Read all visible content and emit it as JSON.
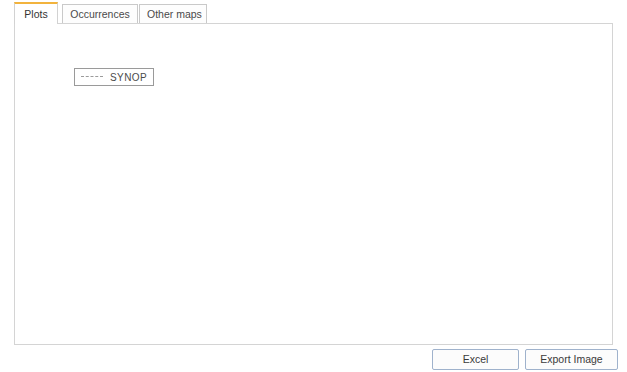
{
  "tabs": [
    {
      "label": "Plots",
      "active": true
    },
    {
      "label": "Occurrences",
      "active": false
    },
    {
      "label": "Other maps",
      "active": false
    }
  ],
  "buttons": {
    "excel": "Excel",
    "export_image": "Export Image"
  },
  "chart_data": {
    "type": "line",
    "title": "Monthly averaged visibility values over station 07157",
    "xlabel": "Months",
    "ylabel": "Averaged visibility (km)",
    "legend": [
      "SYNOP"
    ],
    "legend_position": "upper-left",
    "grid": false,
    "marker": "circle",
    "line_color": "#9b9b9b",
    "marker_color": "#8c8c8c",
    "ylim": [
      3.5,
      28.0
    ],
    "yticks": [
      5,
      10,
      15,
      20,
      25
    ],
    "ytick_labels": [
      "5",
      "10",
      "15",
      "20",
      "25"
    ],
    "xlim": [
      "1996-01",
      "2012-06"
    ],
    "xticks": [
      "2000-01",
      "2005-01",
      "2010-01"
    ],
    "xtick_labels": [
      "2000-01",
      "2005-01",
      "2010-01"
    ],
    "x_start": "1996-01",
    "x_step_months": 1,
    "series": [
      {
        "name": "SYNOP",
        "values": [
          9.6,
          9.4,
          11.0,
          15.2,
          18.9,
          19.4,
          20.5,
          19.1,
          15.0,
          11.0,
          7.4,
          5.0,
          11.1,
          12.9,
          13.0,
          12.3,
          16.5,
          18.6,
          19.0,
          18.8,
          19.2,
          17.7,
          13.9,
          12.2,
          12.5,
          13.0,
          15.4,
          18.0,
          18.3,
          15.5,
          15.2,
          13.4,
          12.7,
          11.6,
          9.9,
          7.9,
          10.4,
          11.7,
          13.3,
          15.2,
          17.1,
          18.6,
          19.9,
          20.2,
          18.9,
          17.6,
          15.4,
          13.2,
          12.0,
          11.8,
          13.0,
          14.7,
          14.0,
          12.3,
          12.6,
          13.6,
          14.5,
          16.2,
          17.2,
          17.6,
          18.3,
          19.5,
          19.2,
          17.9,
          15.6,
          14.6,
          13.4,
          12.5,
          11.3,
          10.4,
          11.3,
          13.1,
          14.8,
          16.5,
          18.1,
          19.4,
          20.0,
          19.0,
          17.5,
          16.4,
          15.0,
          13.7,
          12.3,
          11.0,
          10.3,
          12.4,
          14.3,
          16.0,
          17.4,
          18.6,
          19.1,
          18.2,
          16.9,
          15.4,
          13.0,
          12.1,
          11.8,
          12.5,
          13.6,
          15.1,
          16.6,
          18.0,
          19.7,
          20.6,
          19.2,
          17.4,
          15.6,
          13.4,
          11.2,
          9.8,
          11.6,
          13.5,
          15.2,
          17.6,
          19.8,
          21.3,
          22.3,
          20.4,
          18.1,
          15.5,
          13.0,
          11.4,
          12.8,
          14.9,
          17.0,
          19.6,
          21.2,
          22.8,
          23.0,
          21.4,
          19.0,
          16.0,
          13.4,
          11.6,
          13.2,
          15.5,
          18.4,
          21.0,
          23.6,
          25.4,
          26.5,
          24.1,
          20.9,
          17.6,
          14.4,
          12.0,
          13.8,
          16.2,
          18.7,
          21.4,
          23.5,
          24.6,
          23.3,
          20.7,
          17.8,
          15.3,
          12.6,
          10.8,
          12.6,
          15.0,
          17.8,
          20.6,
          23.0,
          25.8,
          24.8,
          22.2,
          19.2,
          16.4,
          13.6,
          11.0,
          12.4,
          14.6,
          17.0,
          19.8,
          22.4,
          24.2,
          23.0,
          20.3,
          17.2,
          14.8,
          12.2,
          10.3,
          12.0,
          14.8,
          17.9,
          21.0,
          23.8,
          26.2,
          25.3,
          22.6,
          19.4,
          16.6,
          14.0,
          12.5,
          14.2,
          16.8,
          19.6,
          22.4,
          26.8
        ]
      }
    ]
  }
}
